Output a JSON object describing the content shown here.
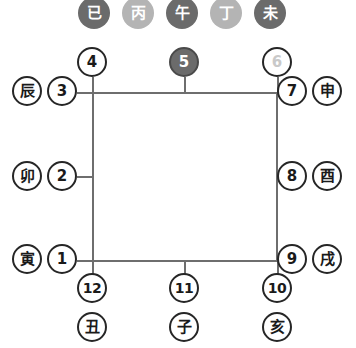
{
  "diagram": {
    "colors": {
      "line": "#6e6e6e",
      "node_border": "#262626",
      "node_fill": "#ffffff",
      "node_text": "#1a1a1a",
      "stem_dark": "#6b6b6b",
      "stem_light": "#b4b4b4",
      "dim_text": "#c9c9c9",
      "filled_text": "#ffffff"
    },
    "stems": [
      {
        "label": "已",
        "tone": "dark",
        "x": 94,
        "y": 13
      },
      {
        "label": "丙",
        "tone": "light",
        "x": 138,
        "y": 13
      },
      {
        "label": "午",
        "tone": "dark",
        "x": 182,
        "y": 13
      },
      {
        "label": "丁",
        "tone": "light",
        "x": 226,
        "y": 13
      },
      {
        "label": "未",
        "tone": "dark",
        "x": 270,
        "y": 13
      }
    ],
    "numbers": [
      {
        "label": "4",
        "style": "plain",
        "x": 92,
        "y": 62
      },
      {
        "label": "5",
        "style": "filled",
        "x": 184,
        "y": 62
      },
      {
        "label": "6",
        "style": "dim",
        "x": 277,
        "y": 62
      },
      {
        "label": "3",
        "style": "plain",
        "x": 62,
        "y": 91
      },
      {
        "label": "7",
        "style": "plain",
        "x": 292,
        "y": 91
      },
      {
        "label": "2",
        "style": "plain",
        "x": 62,
        "y": 176
      },
      {
        "label": "8",
        "style": "plain",
        "x": 292,
        "y": 176
      },
      {
        "label": "1",
        "style": "plain",
        "x": 62,
        "y": 259
      },
      {
        "label": "9",
        "style": "plain",
        "x": 292,
        "y": 259
      },
      {
        "label": "12",
        "style": "plain",
        "x": 92,
        "y": 288
      },
      {
        "label": "11",
        "style": "plain",
        "x": 184,
        "y": 288
      },
      {
        "label": "10",
        "style": "plain",
        "x": 277,
        "y": 288
      }
    ],
    "branches": [
      {
        "label": "辰",
        "x": 27,
        "y": 91
      },
      {
        "label": "申",
        "x": 327,
        "y": 91
      },
      {
        "label": "卯",
        "x": 27,
        "y": 176
      },
      {
        "label": "酉",
        "x": 327,
        "y": 176
      },
      {
        "label": "寅",
        "x": 27,
        "y": 259
      },
      {
        "label": "戌",
        "x": 327,
        "y": 259
      },
      {
        "label": "丑",
        "x": 92,
        "y": 327
      },
      {
        "label": "子",
        "x": 184,
        "y": 327
      },
      {
        "label": "亥",
        "x": 277,
        "y": 327
      }
    ],
    "square": {
      "left": 92,
      "top": 92,
      "right": 278,
      "bottom": 261
    },
    "connectors": [
      {
        "name": "connector-4-top",
        "orient": "v",
        "x": 92,
        "y1": 77,
        "y2": 92
      },
      {
        "name": "connector-5-top",
        "orient": "v",
        "x": 184,
        "y1": 77,
        "y2": 92
      },
      {
        "name": "connector-6-top",
        "orient": "v",
        "x": 277,
        "y1": 77,
        "y2": 92
      },
      {
        "name": "connector-3-left",
        "orient": "h",
        "y": 92,
        "x1": 77,
        "x2": 92
      },
      {
        "name": "connector-7-right",
        "orient": "h",
        "y": 92,
        "x1": 278,
        "x2": 292
      },
      {
        "name": "connector-2-left",
        "orient": "h",
        "y": 176,
        "x1": 77,
        "x2": 92
      },
      {
        "name": "connector-8-right",
        "orient": "h",
        "y": 176,
        "x1": 278,
        "x2": 292
      },
      {
        "name": "connector-1-left",
        "orient": "h",
        "y": 260,
        "x1": 77,
        "x2": 92
      },
      {
        "name": "connector-9-right",
        "orient": "h",
        "y": 260,
        "x1": 278,
        "x2": 292
      },
      {
        "name": "connector-12-bottom",
        "orient": "v",
        "x": 92,
        "y1": 260,
        "y2": 276
      },
      {
        "name": "connector-11-bottom",
        "orient": "v",
        "x": 184,
        "y1": 260,
        "y2": 276
      },
      {
        "name": "connector-10-bottom",
        "orient": "v",
        "x": 277,
        "y1": 260,
        "y2": 276
      }
    ]
  }
}
